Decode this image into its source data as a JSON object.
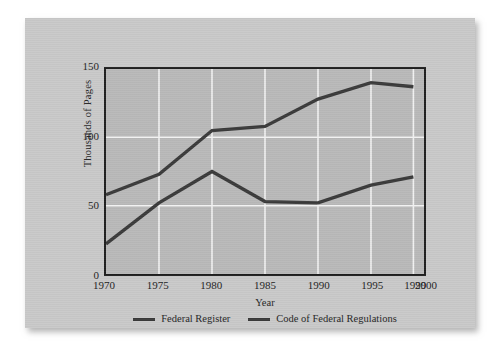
{
  "figure": {
    "background_color": "#ffffff",
    "card_color": "#c9c9c9",
    "plot_background_color": "#b9b9b9",
    "line_color": "#3a3a3a",
    "gridline_color": "#f2f2f2",
    "axis_color": "#1f1f1f"
  },
  "chart_data": {
    "type": "line",
    "title": "",
    "xlabel": "Year",
    "ylabel": "Thousands of Pages",
    "x": [
      1970,
      1975,
      1980,
      1985,
      1990,
      1995,
      1999
    ],
    "xlim": [
      1970,
      2000
    ],
    "ylim": [
      0,
      150
    ],
    "xticks": [
      1970,
      1975,
      1980,
      1985,
      1990,
      1995,
      1999,
      2000
    ],
    "xticklabels": [
      "1970",
      "1975",
      "1980",
      "1985",
      "1990",
      "1995",
      "1999",
      "2000"
    ],
    "yticks": [
      0,
      50,
      100,
      150
    ],
    "yticklabels": [
      "0",
      "50",
      "100",
      "150"
    ],
    "grid": true,
    "legend_position": "bottom",
    "series": [
      {
        "name": "Federal Register",
        "values": [
          22,
          52,
          75,
          53,
          52,
          65,
          71
        ]
      },
      {
        "name": "Code of Federal Regulations",
        "values": [
          58,
          73,
          105,
          108,
          128,
          140,
          137
        ]
      }
    ]
  },
  "legend": {
    "items": [
      {
        "label": "Federal Register"
      },
      {
        "label": "Code of Federal Regulations"
      }
    ]
  }
}
